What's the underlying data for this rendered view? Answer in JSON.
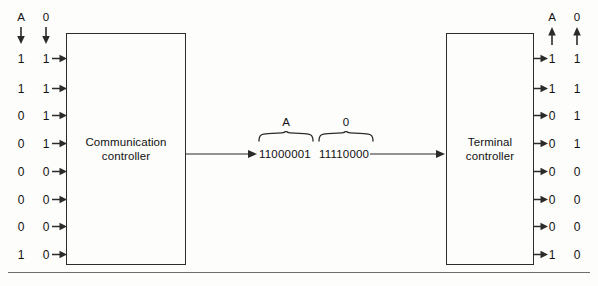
{
  "diagram": {
    "blocks": [
      {
        "id": "communication-controller",
        "line1": "Communication",
        "line2": "controller"
      },
      {
        "id": "terminal-controller",
        "line1": "Terminal",
        "line2": "controller"
      }
    ],
    "left": {
      "headers": [
        {
          "label": "A",
          "direction": "down"
        },
        {
          "label": "0",
          "direction": "down"
        }
      ],
      "column_a": [
        "1",
        "1",
        "0",
        "0",
        "0",
        "0",
        "0",
        "1"
      ],
      "column_zero": [
        "1",
        "1",
        "1",
        "1",
        "0",
        "0",
        "0",
        "0"
      ]
    },
    "right": {
      "headers": [
        {
          "label": "A",
          "direction": "up"
        },
        {
          "label": "0",
          "direction": "up"
        }
      ],
      "column_a": [
        "1",
        "1",
        "0",
        "0",
        "0",
        "0",
        "0",
        "1"
      ],
      "column_zero": [
        "1",
        "1",
        "1",
        "1",
        "0",
        "0",
        "0",
        "0"
      ]
    },
    "serial": {
      "groups": [
        {
          "label": "A",
          "bits": "11000001"
        },
        {
          "label": "0",
          "bits": "11110000"
        }
      ]
    },
    "colors": {
      "line": "#2b2b2b",
      "text": "#111111",
      "rule": "#6f6f6f"
    }
  }
}
